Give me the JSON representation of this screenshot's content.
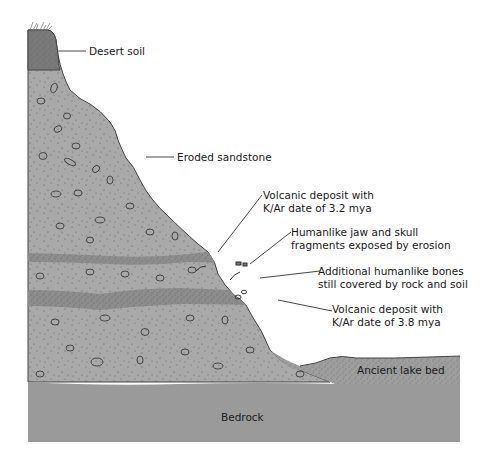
{
  "colors": {
    "sandstone": "#a9a9a9",
    "desert_soil": "#7a7a7a",
    "volcanic_layer": "#8d8d8d",
    "lake_bed": "#9e9e9e",
    "bedrock": "#9a9a9a",
    "outline": "#444444"
  },
  "layers": [
    {
      "id": "desert-soil",
      "label": "Desert soil"
    },
    {
      "id": "eroded-sandstone",
      "label": "Eroded sandstone"
    },
    {
      "id": "volcanic-upper",
      "label_lines": [
        "Volcanic deposit with",
        "K/Ar date of 3.2 mya"
      ]
    },
    {
      "id": "exposed-fossils",
      "label_lines": [
        "Humanlike jaw and skull",
        "fragments exposed by erosion"
      ]
    },
    {
      "id": "buried-fossils",
      "label_lines": [
        "Additional humanlike bones",
        "still covered by rock and soil"
      ]
    },
    {
      "id": "volcanic-lower",
      "label_lines": [
        "Volcanic deposit with",
        "K/Ar date of 3.8 mya"
      ]
    },
    {
      "id": "lake-bed",
      "label": "Ancient lake bed"
    },
    {
      "id": "bedrock",
      "label": "Bedrock"
    }
  ]
}
